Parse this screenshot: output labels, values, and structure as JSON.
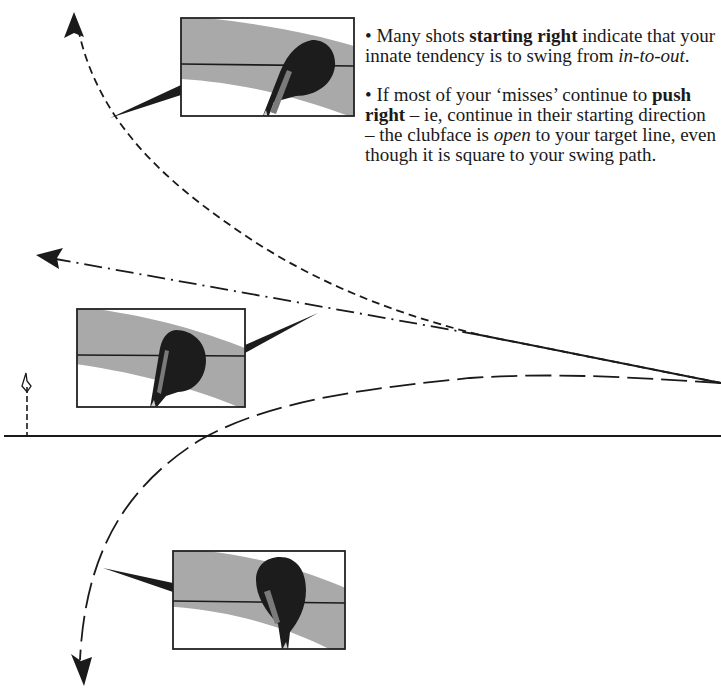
{
  "notes": [
    {
      "parts": [
        {
          "text": "• Many shots ",
          "style": "normal"
        },
        {
          "text": "starting right",
          "style": "bold"
        },
        {
          "text": " indicate that your innate tendency is to swing from ",
          "style": "normal"
        },
        {
          "text": "in-to-out",
          "style": "italic"
        },
        {
          "text": ".",
          "style": "normal"
        }
      ]
    },
    {
      "parts": [
        {
          "text": "• If most of your ‘misses’ continue to ",
          "style": "normal"
        },
        {
          "text": "push right",
          "style": "bold"
        },
        {
          "text": " – ie, continue in their starting direction – the clubface is ",
          "style": "normal"
        },
        {
          "text": "open",
          "style": "italic"
        },
        {
          "text": " to your target line, even though it is square to your swing path.",
          "style": "normal"
        }
      ]
    }
  ],
  "diagram": {
    "colors": {
      "line": "#1a1a1a",
      "band": "#a9a9a9",
      "clubhead": "#1c1c1c",
      "box_border": "#222222",
      "background": "#ffffff"
    },
    "ground_line_y": 436,
    "origin": {
      "x": 721,
      "y": 383
    },
    "flag": {
      "x": 27,
      "top_y": 375
    },
    "paths": [
      {
        "name": "hook-left-up",
        "style": "short-dash",
        "end": "top-left arrow"
      },
      {
        "name": "pull-straight-left",
        "style": "dash-dot",
        "end": "left arrow"
      },
      {
        "name": "slice-right-down",
        "style": "long-dash",
        "end": "bottom-left arrow"
      }
    ],
    "insets": [
      {
        "name": "clubface-inset-top",
        "x": 181,
        "y": 18,
        "w": 173,
        "h": 98
      },
      {
        "name": "clubface-inset-middle",
        "x": 77,
        "y": 309,
        "w": 168,
        "h": 98
      },
      {
        "name": "clubface-inset-bottom",
        "x": 173,
        "y": 551,
        "w": 172,
        "h": 98
      }
    ]
  }
}
